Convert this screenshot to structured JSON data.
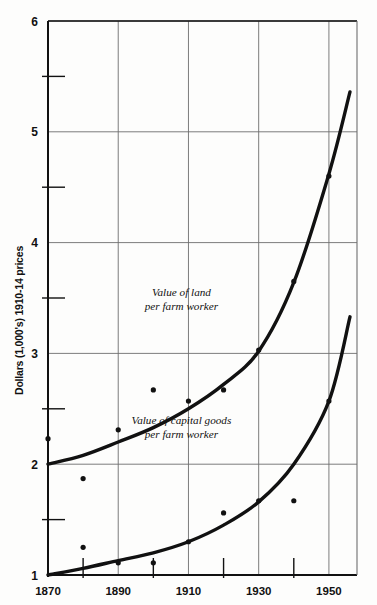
{
  "figure": {
    "background_color": "#fdfdfc",
    "ink_color": "#111111",
    "grid_color": "#6e6e6e"
  },
  "axes": {
    "y_axis_title": "Dollars (1,000's) 1910-14 prices",
    "y_major_ticks": [
      "6",
      "5",
      "4",
      "3",
      "2",
      "1"
    ],
    "y_major_values": [
      6,
      5,
      4,
      3,
      2,
      1
    ],
    "y_minor_values": [
      5.5,
      4.5,
      3.5,
      2.5,
      1.5
    ],
    "x_major_ticks": [
      "1870",
      "1890",
      "1910",
      "1930",
      "1950"
    ],
    "x_major_values": [
      1870,
      1890,
      1910,
      1930,
      1950
    ],
    "x_minor_values": [
      1880,
      1900,
      1920,
      1940,
      1960
    ]
  },
  "annotations": [
    {
      "name": "land-curve-label",
      "line1": "Value of land",
      "line2": "per farm worker",
      "x": 1908,
      "y": 3.52
    },
    {
      "name": "capital-curve-label",
      "line1": "Value of capital goods",
      "line2": "per farm worker",
      "x": 1908,
      "y": 2.36
    }
  ],
  "chart_data": {
    "type": "line",
    "title": "",
    "subtitle": "",
    "xlabel": "",
    "ylabel": "Dollars (1,000's) 1910-14 prices",
    "xlim": [
      1870,
      1958
    ],
    "ylim": [
      1,
      6
    ],
    "grid": true,
    "legend_position": "inline-annotations",
    "x_tick_labels": [
      "1870",
      "1890",
      "1910",
      "1930",
      "1950"
    ],
    "y_tick_labels": [
      "1",
      "2",
      "3",
      "4",
      "5",
      "6"
    ],
    "series": [
      {
        "name": "Value of land per farm worker",
        "type": "line",
        "style": "smooth-thick-black",
        "points": [
          {
            "x": 1870,
            "y": 2.0
          },
          {
            "x": 1880,
            "y": 2.08
          },
          {
            "x": 1890,
            "y": 2.2
          },
          {
            "x": 1900,
            "y": 2.33
          },
          {
            "x": 1910,
            "y": 2.5
          },
          {
            "x": 1920,
            "y": 2.72
          },
          {
            "x": 1930,
            "y": 3.02
          },
          {
            "x": 1940,
            "y": 3.64
          },
          {
            "x": 1950,
            "y": 4.62
          },
          {
            "x": 1956,
            "y": 5.36
          }
        ],
        "scatter": [
          {
            "x": 1870,
            "y": 2.23
          },
          {
            "x": 1890,
            "y": 2.31
          },
          {
            "x": 1900,
            "y": 2.67
          },
          {
            "x": 1910,
            "y": 2.57
          },
          {
            "x": 1920,
            "y": 2.67
          },
          {
            "x": 1930,
            "y": 3.03
          },
          {
            "x": 1940,
            "y": 3.65
          },
          {
            "x": 1950,
            "y": 4.6
          }
        ]
      },
      {
        "name": "Value of capital goods per farm worker",
        "type": "line",
        "style": "smooth-thick-black",
        "points": [
          {
            "x": 1870,
            "y": 1.0
          },
          {
            "x": 1880,
            "y": 1.06
          },
          {
            "x": 1890,
            "y": 1.13
          },
          {
            "x": 1900,
            "y": 1.2
          },
          {
            "x": 1910,
            "y": 1.3
          },
          {
            "x": 1920,
            "y": 1.45
          },
          {
            "x": 1930,
            "y": 1.66
          },
          {
            "x": 1940,
            "y": 2.0
          },
          {
            "x": 1950,
            "y": 2.57
          },
          {
            "x": 1956,
            "y": 3.33
          }
        ],
        "scatter": [
          {
            "x": 1880,
            "y": 1.25
          },
          {
            "x": 1880,
            "y": 1.87
          },
          {
            "x": 1890,
            "y": 1.11
          },
          {
            "x": 1900,
            "y": 1.11
          },
          {
            "x": 1910,
            "y": 1.3
          },
          {
            "x": 1920,
            "y": 1.56
          },
          {
            "x": 1930,
            "y": 1.67
          },
          {
            "x": 1940,
            "y": 1.67
          },
          {
            "x": 1950,
            "y": 2.57
          }
        ]
      }
    ]
  }
}
